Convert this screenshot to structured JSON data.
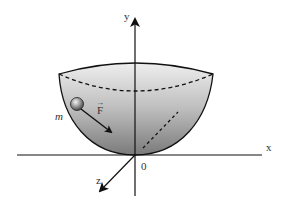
{
  "diagram": {
    "axes": {
      "x_label": "x",
      "y_label": "y",
      "z_label": "z",
      "origin_label": "0"
    },
    "mass": {
      "label": "m"
    },
    "force": {
      "label": "F",
      "vector_arrow": "→"
    },
    "colors": {
      "line": "#111111",
      "bowl_light": "#f2f2f2",
      "bowl_dark": "#8a8a8a",
      "background": "#ffffff"
    }
  }
}
